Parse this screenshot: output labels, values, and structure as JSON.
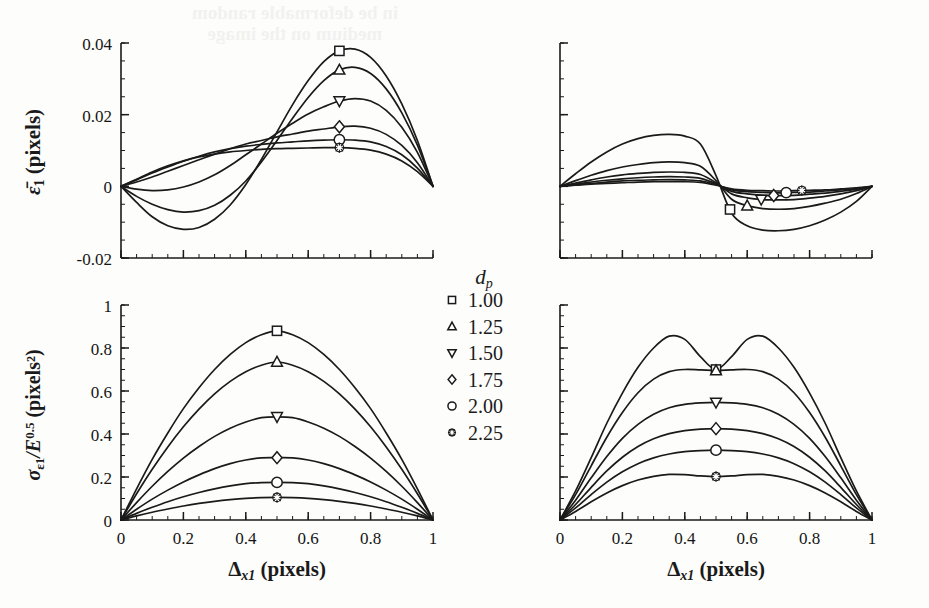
{
  "figure": {
    "background": "#fdfdfb",
    "ink": "#1a1a1a",
    "ghost_text_line1": "in be deformable random",
    "ghost_text_line2": "medium on the image"
  },
  "legend": {
    "title": "d",
    "title_sub": "p",
    "entries": [
      {
        "marker": "square",
        "label": "1.00"
      },
      {
        "marker": "triangle-up",
        "label": "1.25"
      },
      {
        "marker": "triangle-down",
        "label": "1.50"
      },
      {
        "marker": "diamond",
        "label": "1.75"
      },
      {
        "marker": "circle",
        "label": "2.00"
      },
      {
        "marker": "star",
        "label": "2.25"
      }
    ]
  },
  "axis_labels": {
    "x": "Δ",
    "x_sub": "x1",
    "x_unit": "(pixels)",
    "y_top": "ε̄",
    "y_top_sub": "1",
    "y_top_unit": "(pixels)",
    "y_bottom_sigma": "σ",
    "y_bottom_sigma_sub": "ε1",
    "y_bottom_mid": "/E",
    "y_bottom_exp": "0.5",
    "y_bottom_unit": "(pixels²)"
  },
  "chart_data": [
    {
      "id": "top-left",
      "type": "line",
      "title": "",
      "xlabel": "Δx1 (pixels)",
      "ylabel": "ε̄1 (pixels)",
      "xlim": [
        0,
        1
      ],
      "ylim": [
        -0.02,
        0.04
      ],
      "xticks": [
        0,
        0.2,
        0.4,
        0.6,
        0.8,
        1
      ],
      "xticklabels": [
        "",
        "",
        "",
        "",
        "",
        ""
      ],
      "yticks": [
        -0.02,
        0,
        0.02,
        0.04
      ],
      "yticklabels": [
        "-0.02",
        "0",
        "0.02",
        "0.04"
      ],
      "minor_tick_step_x": 0.05,
      "minor_tick_step_y": 0.005,
      "grid": false,
      "legend_position": "none",
      "marker_x": [
        0.7,
        0.7,
        0.7,
        0.7,
        0.7,
        0.7
      ],
      "x": [
        0,
        0.05,
        0.1,
        0.15,
        0.2,
        0.25,
        0.3,
        0.35,
        0.4,
        0.45,
        0.5,
        0.55,
        0.6,
        0.65,
        0.7,
        0.75,
        0.8,
        0.85,
        0.9,
        0.95,
        1.0
      ],
      "series": [
        {
          "name": "1.00",
          "marker": "square",
          "values": [
            0,
            -0.0045,
            -0.0085,
            -0.011,
            -0.012,
            -0.0115,
            -0.0092,
            -0.0052,
            0.0005,
            0.0075,
            0.0152,
            0.0228,
            0.0295,
            0.0348,
            0.0378,
            0.0383,
            0.036,
            0.0308,
            0.023,
            0.0128,
            0
          ]
        },
        {
          "name": "1.25",
          "marker": "triangle-up",
          "values": [
            0,
            -0.0028,
            -0.005,
            -0.0065,
            -0.0072,
            -0.0068,
            -0.0053,
            -0.0025,
            0.0015,
            0.0068,
            0.0128,
            0.019,
            0.0248,
            0.0295,
            0.0325,
            0.0332,
            0.0315,
            0.0272,
            0.0205,
            0.0115,
            0
          ]
        },
        {
          "name": "1.50",
          "marker": "triangle-down",
          "values": [
            0,
            -0.0008,
            -0.0012,
            -0.001,
            -0.0002,
            0.0012,
            0.0032,
            0.0058,
            0.0088,
            0.0118,
            0.0148,
            0.0176,
            0.0202,
            0.0222,
            0.0238,
            0.0245,
            0.0238,
            0.0212,
            0.0165,
            0.0095,
            0
          ]
        },
        {
          "name": "1.75",
          "marker": "diamond",
          "values": [
            0,
            0.0012,
            0.0026,
            0.0042,
            0.0058,
            0.0074,
            0.009,
            0.0105,
            0.0118,
            0.0128,
            0.0138,
            0.0146,
            0.0154,
            0.016,
            0.0166,
            0.0168,
            0.0162,
            0.0145,
            0.0114,
            0.0066,
            0
          ]
        },
        {
          "name": "2.00",
          "marker": "circle",
          "values": [
            0,
            0.0018,
            0.0037,
            0.0054,
            0.007,
            0.0084,
            0.0096,
            0.0105,
            0.0112,
            0.0117,
            0.0121,
            0.0124,
            0.0127,
            0.0129,
            0.013,
            0.0129,
            0.0124,
            0.0111,
            0.0088,
            0.0051,
            0
          ]
        },
        {
          "name": "2.25",
          "marker": "star",
          "values": [
            0,
            0.002,
            0.004,
            0.0057,
            0.0071,
            0.0082,
            0.009,
            0.0096,
            0.01,
            0.0103,
            0.0105,
            0.0106,
            0.0107,
            0.0108,
            0.0108,
            0.0106,
            0.0101,
            0.009,
            0.0071,
            0.0041,
            0
          ]
        }
      ]
    },
    {
      "id": "top-right",
      "type": "line",
      "title": "",
      "xlabel": "Δx1 (pixels)",
      "ylabel": "",
      "xlim": [
        0,
        1
      ],
      "ylim": [
        -0.02,
        0.04
      ],
      "xticks": [
        0,
        0.2,
        0.4,
        0.6,
        0.8,
        1
      ],
      "xticklabels": [
        "",
        "",
        "",
        "",
        "",
        ""
      ],
      "yticks": [
        -0.02,
        0,
        0.02,
        0.04
      ],
      "yticklabels": [
        "",
        "",
        "",
        ""
      ],
      "minor_tick_step_x": 0.05,
      "minor_tick_step_y": 0.005,
      "grid": false,
      "legend_position": "none",
      "marker_x": [
        0.545,
        0.6,
        0.645,
        0.685,
        0.725,
        0.775
      ],
      "x": [
        0,
        0.05,
        0.1,
        0.15,
        0.2,
        0.25,
        0.3,
        0.35,
        0.4,
        0.45,
        0.5,
        0.55,
        0.6,
        0.65,
        0.7,
        0.75,
        0.8,
        0.85,
        0.9,
        0.95,
        1.0
      ],
      "series": [
        {
          "name": "1.00",
          "marker": "square",
          "values": [
            0,
            0.0035,
            0.0068,
            0.0096,
            0.0118,
            0.0133,
            0.0142,
            0.0145,
            0.014,
            0.0118,
            0.003,
            -0.0075,
            -0.011,
            -0.0122,
            -0.0124,
            -0.012,
            -0.011,
            -0.0094,
            -0.0072,
            -0.0042,
            0
          ]
        },
        {
          "name": "1.25",
          "marker": "triangle-up",
          "values": [
            0,
            0.0016,
            0.0031,
            0.0044,
            0.0054,
            0.0061,
            0.0066,
            0.0068,
            0.0066,
            0.0056,
            0.0016,
            -0.0036,
            -0.0054,
            -0.0062,
            -0.0064,
            -0.0062,
            -0.0056,
            -0.0047,
            -0.0036,
            -0.002,
            0
          ]
        },
        {
          "name": "1.50",
          "marker": "triangle-down",
          "values": [
            0,
            0.0009,
            0.0018,
            0.0026,
            0.0032,
            0.0036,
            0.0039,
            0.004,
            0.0039,
            0.0033,
            0.001,
            -0.0021,
            -0.0032,
            -0.0037,
            -0.0038,
            -0.0037,
            -0.0033,
            -0.0028,
            -0.0021,
            -0.0012,
            0
          ]
        },
        {
          "name": "1.75",
          "marker": "diamond",
          "values": [
            0,
            0.0006,
            0.0012,
            0.0017,
            0.0021,
            0.0024,
            0.0026,
            0.0027,
            0.0026,
            0.0022,
            0.0007,
            -0.0014,
            -0.0021,
            -0.0025,
            -0.0026,
            -0.0025,
            -0.0022,
            -0.0019,
            -0.0014,
            -0.0008,
            0
          ]
        },
        {
          "name": "2.00",
          "marker": "circle",
          "values": [
            0,
            0.0004,
            0.0008,
            0.0012,
            0.0015,
            0.0017,
            0.0018,
            0.0019,
            0.0018,
            0.0015,
            0.0005,
            -0.001,
            -0.0015,
            -0.0017,
            -0.0018,
            -0.0017,
            -0.0016,
            -0.0013,
            -0.001,
            -0.0006,
            0
          ]
        },
        {
          "name": "2.25",
          "marker": "star",
          "values": [
            0,
            0.0003,
            0.0006,
            0.0008,
            0.001,
            0.0012,
            0.0013,
            0.0013,
            0.0013,
            0.0011,
            0.0003,
            -0.0007,
            -0.0011,
            -0.0012,
            -0.0013,
            -0.0012,
            -0.0011,
            -0.001,
            -0.0007,
            -0.0004,
            0
          ]
        }
      ]
    },
    {
      "id": "bottom-left",
      "type": "line",
      "title": "",
      "xlabel": "Δx1 (pixels)",
      "ylabel": "σε1/E^0.5 (pixels²)",
      "xlim": [
        0,
        1
      ],
      "ylim": [
        0,
        1
      ],
      "xticks": [
        0,
        0.2,
        0.4,
        0.6,
        0.8,
        1
      ],
      "xticklabels": [
        "0",
        "0.2",
        "0.4",
        "0.6",
        "0.8",
        "1"
      ],
      "yticks": [
        0,
        0.2,
        0.4,
        0.6,
        0.8,
        1
      ],
      "yticklabels": [
        "0",
        "0.2",
        "0.4",
        "0.6",
        "0.8",
        "1"
      ],
      "minor_tick_step_x": 0.05,
      "minor_tick_step_y": 0.05,
      "grid": false,
      "legend_position": "upper-right-outside",
      "marker_x": [
        0.5,
        0.5,
        0.5,
        0.5,
        0.5,
        0.5
      ],
      "x": [
        0,
        0.05,
        0.1,
        0.15,
        0.2,
        0.25,
        0.3,
        0.35,
        0.4,
        0.45,
        0.5,
        0.55,
        0.6,
        0.65,
        0.7,
        0.75,
        0.8,
        0.85,
        0.9,
        0.95,
        1.0
      ],
      "series": [
        {
          "name": "1.00",
          "marker": "square",
          "peak": 0.88,
          "values": [
            0,
            0.145,
            0.282,
            0.405,
            0.518,
            0.615,
            0.7,
            0.77,
            0.825,
            0.862,
            0.88,
            0.862,
            0.825,
            0.77,
            0.7,
            0.615,
            0.518,
            0.405,
            0.282,
            0.145,
            0
          ]
        },
        {
          "name": "1.25",
          "marker": "triangle-up",
          "peak": 0.735,
          "values": [
            0,
            0.122,
            0.236,
            0.34,
            0.434,
            0.516,
            0.587,
            0.645,
            0.69,
            0.72,
            0.735,
            0.72,
            0.69,
            0.645,
            0.587,
            0.516,
            0.434,
            0.34,
            0.236,
            0.122,
            0
          ]
        },
        {
          "name": "1.50",
          "marker": "triangle-down",
          "peak": 0.48,
          "values": [
            0,
            0.081,
            0.157,
            0.226,
            0.288,
            0.342,
            0.389,
            0.427,
            0.456,
            0.476,
            0.48,
            0.476,
            0.456,
            0.427,
            0.389,
            0.342,
            0.288,
            0.226,
            0.157,
            0.081,
            0
          ]
        },
        {
          "name": "1.75",
          "marker": "diamond",
          "peak": 0.29,
          "values": [
            0,
            0.05,
            0.097,
            0.139,
            0.177,
            0.21,
            0.239,
            0.262,
            0.279,
            0.289,
            0.29,
            0.289,
            0.279,
            0.262,
            0.239,
            0.21,
            0.177,
            0.139,
            0.097,
            0.05,
            0
          ]
        },
        {
          "name": "2.00",
          "marker": "circle",
          "peak": 0.175,
          "values": [
            0,
            0.031,
            0.059,
            0.085,
            0.108,
            0.128,
            0.145,
            0.159,
            0.169,
            0.174,
            0.175,
            0.174,
            0.169,
            0.159,
            0.145,
            0.128,
            0.108,
            0.085,
            0.059,
            0.031,
            0
          ]
        },
        {
          "name": "2.25",
          "marker": "star",
          "peak": 0.105,
          "values": [
            0,
            0.019,
            0.036,
            0.051,
            0.065,
            0.077,
            0.087,
            0.095,
            0.101,
            0.104,
            0.105,
            0.104,
            0.101,
            0.095,
            0.087,
            0.077,
            0.065,
            0.051,
            0.036,
            0.019,
            0
          ]
        }
      ]
    },
    {
      "id": "bottom-right",
      "type": "line",
      "title": "",
      "xlabel": "Δx1 (pixels)",
      "ylabel": "",
      "xlim": [
        0,
        1
      ],
      "ylim": [
        0,
        1
      ],
      "xticks": [
        0,
        0.2,
        0.4,
        0.6,
        0.8,
        1
      ],
      "xticklabels": [
        "0",
        "0.2",
        "0.4",
        "0.6",
        "0.8",
        "1"
      ],
      "yticks": [
        0,
        0.2,
        0.4,
        0.6,
        0.8,
        1
      ],
      "yticklabels": [
        "",
        "",
        "",
        "",
        "",
        ""
      ],
      "minor_tick_step_x": 0.05,
      "minor_tick_step_y": 0.05,
      "grid": false,
      "legend_position": "none",
      "marker_x": [
        0.5,
        0.5,
        0.5,
        0.5,
        0.5,
        0.5
      ],
      "x": [
        0,
        0.05,
        0.1,
        0.15,
        0.2,
        0.25,
        0.3,
        0.35,
        0.4,
        0.45,
        0.5,
        0.55,
        0.6,
        0.65,
        0.7,
        0.75,
        0.8,
        0.85,
        0.9,
        0.95,
        1.0
      ],
      "series": [
        {
          "name": "1.00",
          "marker": "square",
          "values": [
            0,
            0.135,
            0.29,
            0.45,
            0.59,
            0.71,
            0.8,
            0.855,
            0.84,
            0.76,
            0.7,
            0.76,
            0.84,
            0.855,
            0.8,
            0.71,
            0.59,
            0.45,
            0.29,
            0.135,
            0
          ]
        },
        {
          "name": "1.25",
          "marker": "triangle-up",
          "values": [
            0,
            0.118,
            0.252,
            0.385,
            0.5,
            0.592,
            0.655,
            0.69,
            0.7,
            0.698,
            0.695,
            0.698,
            0.7,
            0.69,
            0.655,
            0.592,
            0.5,
            0.385,
            0.252,
            0.118,
            0
          ]
        },
        {
          "name": "1.50",
          "marker": "triangle-down",
          "values": [
            0,
            0.092,
            0.196,
            0.295,
            0.38,
            0.445,
            0.492,
            0.522,
            0.538,
            0.545,
            0.547,
            0.545,
            0.538,
            0.522,
            0.492,
            0.445,
            0.38,
            0.295,
            0.196,
            0.092,
            0
          ]
        },
        {
          "name": "1.75",
          "marker": "diamond",
          "values": [
            0,
            0.072,
            0.152,
            0.228,
            0.292,
            0.342,
            0.378,
            0.402,
            0.416,
            0.423,
            0.425,
            0.423,
            0.416,
            0.402,
            0.378,
            0.342,
            0.292,
            0.228,
            0.152,
            0.072,
            0
          ]
        },
        {
          "name": "2.00",
          "marker": "circle",
          "values": [
            0,
            0.056,
            0.118,
            0.176,
            0.224,
            0.262,
            0.289,
            0.307,
            0.318,
            0.323,
            0.325,
            0.323,
            0.318,
            0.307,
            0.289,
            0.262,
            0.224,
            0.176,
            0.118,
            0.056,
            0
          ]
        },
        {
          "name": "2.25",
          "marker": "star",
          "values": [
            0,
            0.04,
            0.085,
            0.126,
            0.16,
            0.186,
            0.203,
            0.212,
            0.211,
            0.205,
            0.202,
            0.205,
            0.211,
            0.212,
            0.203,
            0.186,
            0.16,
            0.126,
            0.085,
            0.04,
            0
          ]
        }
      ]
    }
  ]
}
